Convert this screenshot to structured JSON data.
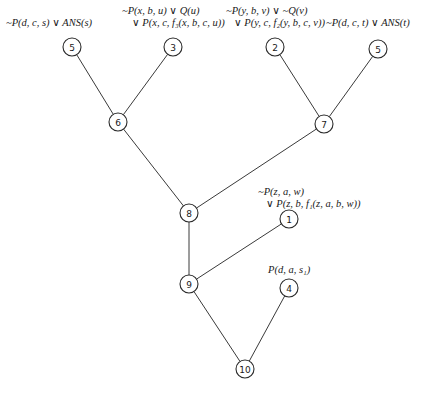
{
  "diagram": {
    "type": "resolution-refutation-tree",
    "nodes": [
      {
        "id": "5a",
        "number": "5",
        "x": 72,
        "y": 47
      },
      {
        "id": "3",
        "number": "3",
        "x": 173,
        "y": 47
      },
      {
        "id": "2",
        "number": "2",
        "x": 275,
        "y": 47
      },
      {
        "id": "5b",
        "number": "5",
        "x": 378,
        "y": 49
      },
      {
        "id": "6",
        "number": "6",
        "x": 118,
        "y": 122
      },
      {
        "id": "7",
        "number": "7",
        "x": 324,
        "y": 124
      },
      {
        "id": "8",
        "number": "8",
        "x": 189,
        "y": 213
      },
      {
        "id": "1",
        "number": "1",
        "x": 289,
        "y": 219
      },
      {
        "id": "9",
        "number": "9",
        "x": 189,
        "y": 284
      },
      {
        "id": "4",
        "number": "4",
        "x": 289,
        "y": 288
      },
      {
        "id": "10",
        "number": "10",
        "x": 245,
        "y": 369
      }
    ],
    "edges": [
      [
        "5a",
        "6"
      ],
      [
        "3",
        "6"
      ],
      [
        "2",
        "7"
      ],
      [
        "5b",
        "7"
      ],
      [
        "6",
        "8"
      ],
      [
        "7",
        "8"
      ],
      [
        "8",
        "9"
      ],
      [
        "1",
        "9"
      ],
      [
        "9",
        "10"
      ],
      [
        "4",
        "10"
      ]
    ],
    "labels": {
      "node5a": [
        "~P(d, c, s) ∨ ANS(s)"
      ],
      "node3": [
        "~P(x, b, u) ∨ Q(u)",
        "∨ P(x, c, f₃(x, b, c, u))"
      ],
      "node2": [
        "~P(y, b, v) ∨ ~Q(v)",
        "∨ P(y, c, f₂(y, b, c, v))"
      ],
      "node5b": [
        "~P(d, c, t) ∨ ANS(t)"
      ],
      "node1": [
        "~P(z, a, w)",
        "∨ P(z, b, f₁(z, a, b, w))"
      ],
      "node4": [
        "P(d, a, s₁)"
      ]
    }
  }
}
